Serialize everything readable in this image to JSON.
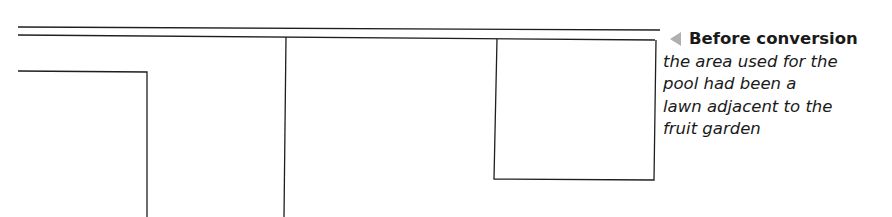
{
  "caption": {
    "arrow_icon": "left-pointer-triangle",
    "title": "Before conversion",
    "body_lines": [
      "the area used for the",
      "pool had been a",
      "lawn adjacent to the",
      "fruit garden"
    ]
  },
  "colors": {
    "line": "#1e1e1e",
    "arrow": "#b0b0b0",
    "text": "#1a1a1a"
  }
}
